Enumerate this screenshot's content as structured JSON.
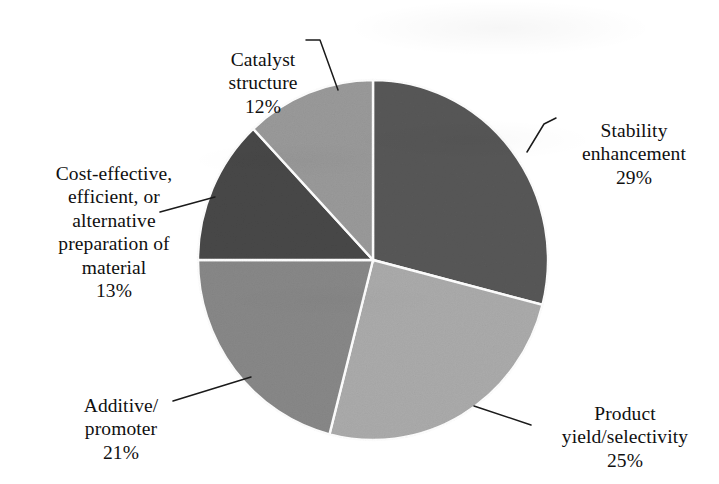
{
  "chart_data": {
    "type": "pie",
    "title": "",
    "subtitle": "",
    "xlabel": "",
    "ylabel": "",
    "legend_position": "none",
    "grid": false,
    "start_angle_deg": 0,
    "direction": "clockwise",
    "labels_outside": true,
    "leader_lines": true,
    "categories": [
      "Stability enhancement",
      "Product yield/selectivity",
      "Additive/ promoter",
      "Cost-effective, efficient, or alternative preparation of material",
      "Catalyst structure"
    ],
    "values": [
      29,
      25,
      21,
      13,
      12
    ],
    "value_unit": "%",
    "colors": [
      "#585858",
      "#ababab",
      "#888888",
      "#484848",
      "#9a9a9a"
    ],
    "slices": [
      {
        "name": "stability-enhancement",
        "label_lines": "Stability\nenhancement",
        "value": 29,
        "value_label": "29%",
        "color": "#585858"
      },
      {
        "name": "product-yield-selectivity",
        "label_lines": "Product\nyield/selectivity",
        "value": 25,
        "value_label": "25%",
        "color": "#ababab"
      },
      {
        "name": "additive-promoter",
        "label_lines": "Additive/\npromoter",
        "value": 21,
        "value_label": "21%",
        "color": "#888888"
      },
      {
        "name": "cost-effective-preparation",
        "label_lines": "Cost-effective,\nefficient, or\nalternative\npreparation of\nmaterial",
        "value": 13,
        "value_label": "13%",
        "color": "#484848"
      },
      {
        "name": "catalyst-structure",
        "label_lines": "Catalyst\nstructure",
        "value": 12,
        "value_label": "12%",
        "color": "#9a9a9a"
      }
    ]
  },
  "labels": {
    "catalyst_structure": {
      "text": "Catalyst\nstructure",
      "percent": "12%"
    },
    "cost_effective": {
      "text": "Cost-effective,\nefficient, or\nalternative\npreparation of\nmaterial",
      "percent": "13%"
    },
    "additive_promoter": {
      "text": "Additive/\npromoter",
      "percent": "21%"
    },
    "stability_enhancement": {
      "text": "Stability\nenhancement",
      "percent": "29%"
    },
    "product_yield": {
      "text": "Product\nyield/selectivity",
      "percent": "25%"
    }
  },
  "style": {
    "background": "#ffffff",
    "slice_border": "#ffffff",
    "leader_line_color": "#1a1a1a",
    "text_color": "#101010"
  }
}
